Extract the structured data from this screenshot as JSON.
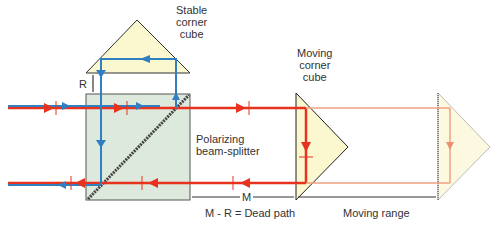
{
  "labels": {
    "stable_cube": [
      "Stable",
      "corner",
      "cube"
    ],
    "moving_cube": [
      "Moving",
      "corner",
      "cube"
    ],
    "beam_splitter": [
      "Polarizing",
      "beam-splitter"
    ],
    "r_label": "R",
    "m_label": "M",
    "dead_path": "M - R = Dead path",
    "moving_range": "Moving range"
  },
  "colors": {
    "red_beam": "#e8321e",
    "blue_beam": "#2f7fc1",
    "cube_fill": "#fbf7cf",
    "splitter_fill": "#dde9dc",
    "faded_beam": "#f0a080"
  }
}
